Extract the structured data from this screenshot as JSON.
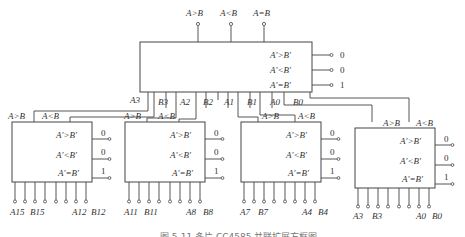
{
  "top_comparator": {
    "outputs_top": [
      "A>B",
      "A<B",
      "A=B"
    ],
    "ports": [
      "A'>B'",
      "A'<B'",
      "A'=B'"
    ],
    "port_values": [
      "0",
      "0",
      "1"
    ],
    "inputs_bottom": [
      "A3",
      "B3",
      "A2",
      "B2",
      "A1",
      "B1",
      "A0",
      "B0"
    ]
  },
  "stage_comparators": [
    {
      "cascade_outputs": [
        "A>B",
        "A<B"
      ],
      "ports": [
        "A'>B'",
        "A'<B'",
        "A'=B'"
      ],
      "port_values": [
        "0",
        "0",
        "1"
      ],
      "pin_labels": {
        "a_high": "A15",
        "b_high": "B15",
        "a_low": "A12",
        "b_low": "B12"
      }
    },
    {
      "cascade_outputs": [
        "A>B",
        "A<B"
      ],
      "ports": [
        "A'>B'",
        "A'<B'",
        "A'=B'"
      ],
      "port_values": [
        "0",
        "0",
        "1"
      ],
      "pin_labels": {
        "a_high": "A11",
        "b_high": "B11",
        "a_low": "A8",
        "b_low": "B8"
      }
    },
    {
      "cascade_outputs": [
        "A>B",
        "A<B"
      ],
      "ports": [
        "A'>B'",
        "A'<B'",
        "A'=B'"
      ],
      "port_values": [
        "0",
        "0",
        "1"
      ],
      "pin_labels": {
        "a_high": "A7",
        "b_high": "B7",
        "a_low": "A4",
        "b_low": "B4"
      }
    },
    {
      "cascade_outputs": [
        "A>B",
        "A<B"
      ],
      "ports": [
        "A'>B'",
        "A'<B'",
        "A'=B'"
      ],
      "port_values": [
        "0",
        "0",
        "1"
      ],
      "pin_labels": {
        "a_high": "A3",
        "b_high": "B3",
        "a_low": "A0",
        "b_low": "B0"
      }
    }
  ],
  "caption": "图 5-11  多片 CC4585 并联扩展方框图"
}
